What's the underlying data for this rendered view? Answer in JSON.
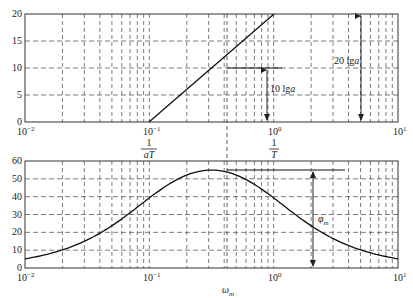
{
  "figure": {
    "top_plot": {
      "y_ticks": [
        "0",
        "5",
        "10",
        "15",
        "20"
      ],
      "x_ticks": [
        "10^-2",
        "10^-1",
        "10^0",
        "10^1"
      ],
      "annotation_10lga": "10 lg a",
      "annotation_20lga": "20 lg a"
    },
    "bottom_plot": {
      "y_ticks": [
        "0",
        "10",
        "20",
        "30",
        "40",
        "50",
        "60"
      ],
      "x_ticks": [
        "10^-2",
        "10^-1",
        "10^0",
        "10^1"
      ],
      "label_1_over_aT": "1/aT",
      "label_1_over_T": "1/T",
      "label_omega_m": "ωm",
      "label_phi_m": "φm"
    }
  },
  "chart_data": [
    {
      "type": "line",
      "title": "",
      "xlabel": "",
      "ylabel": "",
      "xscale": "log",
      "xlim": [
        0.01,
        10
      ],
      "ylim": [
        0,
        20
      ],
      "grid": true,
      "x_tick_labels": [
        "10^-2",
        "10^-1",
        "10^0",
        "10^1"
      ],
      "y_tick_labels": [
        "0",
        "5",
        "10",
        "15",
        "20"
      ],
      "series": [
        {
          "name": "asymptotic magnitude (dB)",
          "x": [
            0.1,
            0.316,
            1.0
          ],
          "y": [
            0,
            10,
            20
          ]
        }
      ],
      "annotations": [
        {
          "text": "10 lg a",
          "type": "double-arrow",
          "x": 0.8,
          "y_range": [
            0,
            10
          ]
        },
        {
          "text": "20 lg a",
          "type": "double-arrow",
          "x": 5.5,
          "y_range": [
            0,
            20
          ]
        },
        {
          "type": "hline",
          "y": 10,
          "x_range": [
            0.316,
            1.1
          ]
        }
      ]
    },
    {
      "type": "line",
      "title": "",
      "xlabel": "ωm",
      "ylabel": "",
      "xscale": "log",
      "xlim": [
        0.01,
        10
      ],
      "ylim": [
        0,
        60
      ],
      "grid": true,
      "x_tick_labels": [
        "10^-2",
        "10^-1",
        "10^0",
        "10^1"
      ],
      "y_tick_labels": [
        "0",
        "10",
        "20",
        "30",
        "40",
        "50",
        "60"
      ],
      "series": [
        {
          "name": "phase (deg)",
          "x": [
            0.01,
            0.02,
            0.05,
            0.1,
            0.2,
            0.316,
            0.5,
            1.0,
            2.0,
            5.0,
            10.0
          ],
          "y": [
            5.1,
            10.0,
            22.9,
            39.3,
            52.1,
            54.9,
            51.3,
            39.3,
            24.9,
            10.5,
            5.1
          ]
        }
      ],
      "annotations": [
        {
          "text": "1/aT",
          "x": 0.1
        },
        {
          "text": "1/T",
          "x": 1.0
        },
        {
          "text": "ωm",
          "x": 0.316,
          "type": "vline"
        },
        {
          "text": "φm",
          "type": "double-arrow",
          "x": 2.2,
          "y_range": [
            0,
            54.9
          ]
        },
        {
          "type": "hline",
          "y": 54.9,
          "x_range": [
            0.316,
            2.8
          ]
        }
      ]
    }
  ]
}
